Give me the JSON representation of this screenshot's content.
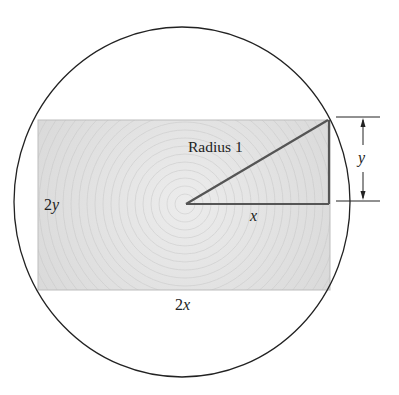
{
  "diagram": {
    "labels": {
      "radius": "Radius 1",
      "height_full": "2y",
      "height_full_num": "2",
      "height_full_var": "y",
      "width_full": "2x",
      "width_full_num": "2",
      "width_full_var": "x",
      "half_width": "x",
      "half_height": "y"
    },
    "colors": {
      "stroke": "#222222",
      "rect_fill": "#d9d9d9",
      "triangle_stroke": "#555555",
      "background": "#ffffff"
    },
    "geometry": {
      "circle": {
        "cx": 182,
        "cy": 202,
        "rx": 168,
        "ry": 175
      },
      "rectangle": {
        "x": 38,
        "y": 120,
        "width": 292,
        "height": 170
      },
      "center": {
        "x": 185,
        "y": 204
      },
      "corner": {
        "x": 329,
        "y": 119
      }
    }
  }
}
